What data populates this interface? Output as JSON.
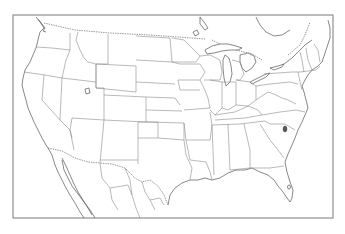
{
  "map": {
    "type": "outline-map",
    "region": "Contiguous United States with southern Canada and northern Mexico",
    "style": "blank state outline map",
    "frame": {
      "x": 13,
      "y": 15,
      "width": 320,
      "height": 203,
      "stroke": "#7a7a7a"
    },
    "colors": {
      "background": "#ffffff",
      "state_border": "#8a8a8a",
      "coastline": "#555555",
      "international_border": "#666666",
      "highlight_marker": "#555555"
    },
    "features": [
      {
        "name": "state-boundaries",
        "label": "U.S. state boundaries"
      },
      {
        "name": "great-lakes",
        "label": "Great Lakes"
      },
      {
        "name": "us-canada-border",
        "label": "US–Canada border (dotted)"
      },
      {
        "name": "us-mexico-border",
        "label": "US–Mexico border (dotted)"
      },
      {
        "name": "great-salt-lake",
        "label": "Great Salt Lake"
      },
      {
        "name": "lake-okeechobee",
        "label": "Lake Okeechobee"
      }
    ],
    "highlight": {
      "label": "Marked point in eastern North Carolina / South Carolina area",
      "x": 285,
      "y": 130
    }
  }
}
